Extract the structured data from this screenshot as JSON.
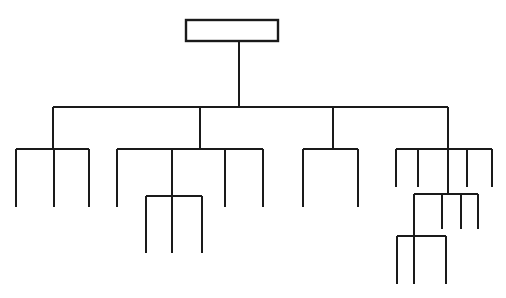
{
  "document": {
    "title": "Organizational Chart",
    "kind": "hierarchy-tree-diagram",
    "background_color": "#ffffff",
    "line_color": "#1a1a1a",
    "canvas": {
      "width": 506,
      "height": 298
    }
  },
  "chart_data": {
    "type": "diagram",
    "subtype": "organizational-chart",
    "title": "",
    "labels_visible": false,
    "note": "All nodes are drawn as blank (unlabeled) boxes and bare connector stubs; only the root node is drawn as a rectangle outline.",
    "root": {
      "label": "",
      "box": {
        "x": 186,
        "y": 20,
        "width": 92,
        "height": 21
      },
      "stem": {
        "x": 239,
        "from_y": 41,
        "to_y": 107
      }
    },
    "bus": {
      "y": 107,
      "x_start": 53,
      "x_end": 448,
      "drops": [
        53,
        200,
        333,
        448
      ]
    },
    "groups": [
      {
        "name": "group-1",
        "parent_drop_x": 53,
        "bar_y": 149,
        "bar_x_start": 16,
        "bar_x_end": 89,
        "legs": [
          {
            "x": 16,
            "bottom_y": 207
          },
          {
            "x": 54,
            "bottom_y": 207
          },
          {
            "x": 89,
            "bottom_y": 207
          }
        ]
      },
      {
        "name": "group-2",
        "parent_drop_x": 200,
        "bar_y": 149,
        "bar_x_start": 117,
        "bar_x_end": 263,
        "legs": [
          {
            "x": 117,
            "bottom_y": 207
          },
          {
            "x": 172,
            "bottom_y": 196
          },
          {
            "x": 225,
            "bottom_y": 207
          },
          {
            "x": 263,
            "bottom_y": 207
          }
        ],
        "sub_group": {
          "name": "group-2-sub",
          "parent_drop_x": 172,
          "bar_y": 196,
          "bar_x_start": 146,
          "bar_x_end": 202,
          "legs": [
            {
              "x": 146,
              "bottom_y": 253
            },
            {
              "x": 172,
              "bottom_y": 253
            },
            {
              "x": 202,
              "bottom_y": 253
            }
          ]
        }
      },
      {
        "name": "group-3",
        "parent_drop_x": 333,
        "bar_y": 149,
        "bar_x_start": 303,
        "bar_x_end": 358,
        "legs": [
          {
            "x": 303,
            "bottom_y": 207
          },
          {
            "x": 358,
            "bottom_y": 207
          }
        ]
      },
      {
        "name": "group-4",
        "parent_drop_x": 448,
        "bar_y": 149,
        "bar_x_start": 396,
        "bar_x_end": 492,
        "legs": [
          {
            "x": 396,
            "bottom_y": 187
          },
          {
            "x": 418,
            "bottom_y": 187
          },
          {
            "x": 448,
            "bottom_y": 194
          },
          {
            "x": 467,
            "bottom_y": 187
          },
          {
            "x": 492,
            "bottom_y": 187
          }
        ],
        "sub_group": {
          "name": "group-4-sub",
          "parent_drop_x": 448,
          "bar_y": 194,
          "bar_x_start": 414,
          "bar_x_end": 478,
          "legs": [
            {
              "x": 414,
              "bottom_y": 236
            },
            {
              "x": 442,
              "bottom_y": 229
            },
            {
              "x": 461,
              "bottom_y": 229
            },
            {
              "x": 478,
              "bottom_y": 229
            }
          ],
          "sub_group": {
            "name": "group-4-sub-sub",
            "parent_drop_x": 414,
            "bar_y": 236,
            "bar_x_start": 397,
            "bar_x_end": 446,
            "legs": [
              {
                "x": 397,
                "bottom_y": 284
              },
              {
                "x": 414,
                "bottom_y": 284
              },
              {
                "x": 446,
                "bottom_y": 284
              }
            ]
          }
        }
      }
    ],
    "totals": {
      "levels": 5,
      "top_level_branches": 4,
      "leaf_stubs": 18
    }
  }
}
